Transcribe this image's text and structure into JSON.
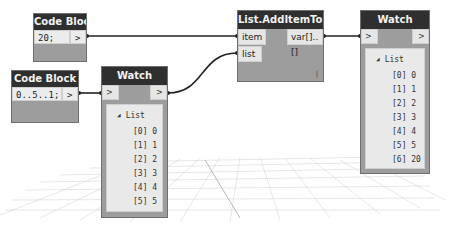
{
  "canvas": {
    "background": "#ffffff",
    "grid_color": "#c8c8c8"
  },
  "nodes": {
    "code_block_1": {
      "title": "Code Block",
      "code": "20;",
      "output_port": ">"
    },
    "code_block_2": {
      "title": "Code Block",
      "code": "0..5..1;",
      "output_port": ">"
    },
    "watch_1": {
      "title": "Watch",
      "input_port": ">",
      "output_port": ">",
      "list_label": "List",
      "items": [
        "[0] 0",
        "[1] 1",
        "[2] 2",
        "[3] 3",
        "[4] 4",
        "[5] 5"
      ]
    },
    "add_item": {
      "title": "List.AddItemToEnd",
      "inputs": [
        "item",
        "list"
      ],
      "output": "var[]..[]",
      "lacing_glyph": "|"
    },
    "watch_2": {
      "title": "Watch",
      "input_port": ">",
      "output_port": ">",
      "list_label": "List",
      "items": [
        "[0] 0",
        "[1] 1",
        "[2] 2",
        "[3] 3",
        "[4] 4",
        "[5] 5",
        "[6] 20"
      ]
    }
  },
  "colors": {
    "header": "#2f2f2f",
    "header_text": "#f2f2f2",
    "body": "#9d9d9d",
    "port": "#e6e6e6",
    "wire": "#222222"
  }
}
